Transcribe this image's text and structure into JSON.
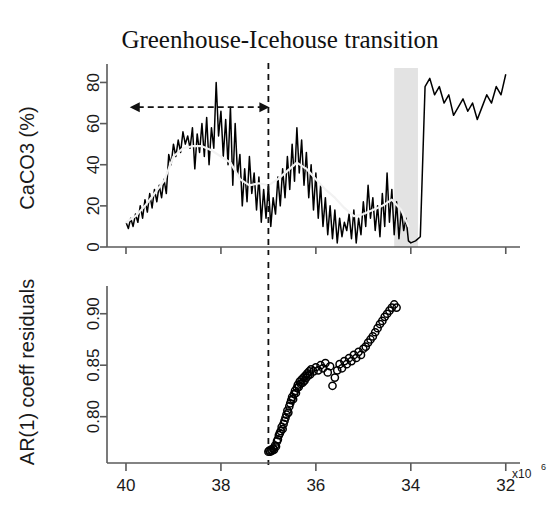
{
  "title": "Greenhouse-Icehouse transition",
  "chart_data": {
    "type": "line",
    "title": "Greenhouse-Icehouse transition",
    "panels": [
      {
        "id": "caco3-panel",
        "ylabel": "CaCO3 (%)",
        "ytick_labels": [
          "0",
          "20",
          "40",
          "60",
          "80"
        ],
        "ytick_values": [
          0,
          20,
          40,
          60,
          80
        ],
        "ylim": [
          0,
          88
        ],
        "grid": false,
        "series": [
          {
            "name": "CaCO3 record",
            "style": "noisy-line",
            "color": "#000000",
            "x": [
              40.0,
              39.95,
              39.9,
              39.85,
              39.8,
              39.75,
              39.7,
              39.65,
              39.6,
              39.55,
              39.5,
              39.45,
              39.4,
              39.35,
              39.3,
              39.25,
              39.2,
              39.15,
              39.1,
              39.05,
              39.0,
              38.95,
              38.9,
              38.85,
              38.8,
              38.75,
              38.7,
              38.65,
              38.6,
              38.55,
              38.5,
              38.45,
              38.4,
              38.35,
              38.3,
              38.25,
              38.2,
              38.15,
              38.1,
              38.05,
              38.0,
              37.95,
              37.9,
              37.85,
              37.8,
              37.75,
              37.7,
              37.65,
              37.6,
              37.55,
              37.5,
              37.45,
              37.4,
              37.35,
              37.3,
              37.25,
              37.2,
              37.15,
              37.1,
              37.05,
              37.0,
              36.95,
              36.9,
              36.85,
              36.8,
              36.75,
              36.7,
              36.65,
              36.6,
              36.55,
              36.5,
              36.45,
              36.4,
              36.35,
              36.3,
              36.25,
              36.2,
              36.15,
              36.1,
              36.05,
              36.0,
              35.95,
              35.9,
              35.85,
              35.8,
              35.75,
              35.7,
              35.65,
              35.6,
              35.55,
              35.5,
              35.45,
              35.4,
              35.35,
              35.3,
              35.25,
              35.2,
              35.15,
              35.1,
              35.05,
              35.0,
              34.95,
              34.9,
              34.85,
              34.8,
              34.75,
              34.7,
              34.65,
              34.6,
              34.55,
              34.5,
              34.45,
              34.4,
              34.35,
              34.3,
              34.25,
              34.2,
              34.15,
              34.1,
              34.05,
              34.0,
              33.9,
              33.8,
              33.7,
              33.6,
              33.5,
              33.4,
              33.3,
              33.2,
              33.1,
              33.0,
              32.9,
              32.8,
              32.7,
              32.6,
              32.5,
              32.4,
              32.3,
              32.2,
              32.1,
              32.0
            ],
            "y": [
              12,
              9,
              14,
              10,
              16,
              12,
              20,
              14,
              23,
              17,
              26,
              19,
              28,
              22,
              30,
              24,
              33,
              26,
              45,
              40,
              50,
              44,
              52,
              46,
              56,
              50,
              54,
              48,
              58,
              38,
              55,
              46,
              60,
              44,
              63,
              40,
              58,
              48,
              80,
              54,
              66,
              44,
              62,
              40,
              68,
              30,
              60,
              35,
              45,
              20,
              38,
              22,
              44,
              26,
              36,
              18,
              34,
              12,
              28,
              14,
              30,
              10,
              24,
              16,
              34,
              20,
              38,
              24,
              44,
              28,
              50,
              32,
              58,
              36,
              52,
              30,
              46,
              24,
              40,
              18,
              36,
              14,
              30,
              10,
              24,
              6,
              20,
              4,
              18,
              2,
              14,
              5,
              12,
              8,
              16,
              4,
              18,
              2,
              14,
              6,
              22,
              10,
              30,
              14,
              24,
              8,
              20,
              5,
              26,
              10,
              36,
              12,
              28,
              6,
              22,
              4,
              18,
              8,
              14,
              3,
              2,
              3,
              5,
              78,
              82,
              74,
              78,
              70,
              74,
              64,
              68,
              72,
              66,
              70,
              62,
              68,
              74,
              70,
              78,
              74,
              84
            ]
          },
          {
            "name": "CaCO3 smoothed trend",
            "style": "smooth-line",
            "color": "#f2f2f2",
            "x": [
              40.0,
              39.8,
              39.6,
              39.4,
              39.2,
              39.0,
              38.8,
              38.6,
              38.4,
              38.2,
              38.0,
              37.8,
              37.6,
              37.4,
              37.2,
              37.0,
              36.8,
              36.6,
              36.4,
              36.2,
              36.0,
              35.8,
              35.6,
              35.4,
              35.2,
              35.0,
              34.8,
              34.6,
              34.4,
              34.2,
              34.05
            ],
            "y": [
              12,
              15,
              20,
              26,
              32,
              44,
              48,
              49,
              49,
              47,
              44,
              41,
              33,
              30,
              31,
              30,
              33,
              37,
              41,
              38,
              33,
              28,
              24,
              19,
              15,
              16,
              18,
              20,
              23,
              18,
              10
            ]
          }
        ],
        "annotations": {
          "dashed_vertical_line_x": 37.0,
          "shaded_band": {
            "x_start": 34.35,
            "x_end": 33.85,
            "color": "#e3e3e3"
          },
          "double_arrow": {
            "x_start": 39.9,
            "x_end": 37.0,
            "y": 68,
            "style": "dashed-double-headed"
          }
        }
      },
      {
        "id": "ar1-panel",
        "ylabel": "AR(1) coeff residuals",
        "ytick_labels": [
          "0.80",
          "0.85",
          "0.90"
        ],
        "ytick_values": [
          0.8,
          0.85,
          0.9
        ],
        "ylim": [
          0.755,
          0.925
        ],
        "grid": false,
        "series": [
          {
            "name": "AR(1) coefficient residuals",
            "style": "open-circles",
            "color": "#000000",
            "x": [
              37.0,
              36.98,
              36.96,
              36.94,
              36.92,
              36.9,
              36.88,
              36.86,
              36.84,
              36.82,
              36.8,
              36.78,
              36.76,
              36.74,
              36.72,
              36.7,
              36.68,
              36.66,
              36.64,
              36.62,
              36.6,
              36.58,
              36.56,
              36.54,
              36.52,
              36.5,
              36.48,
              36.46,
              36.44,
              36.42,
              36.4,
              36.38,
              36.36,
              36.34,
              36.32,
              36.3,
              36.28,
              36.26,
              36.24,
              36.22,
              36.2,
              36.18,
              36.16,
              36.14,
              36.12,
              36.1,
              36.05,
              36.0,
              35.95,
              35.9,
              35.85,
              35.8,
              35.75,
              35.7,
              35.65,
              35.6,
              35.55,
              35.5,
              35.45,
              35.4,
              35.35,
              35.3,
              35.25,
              35.2,
              35.15,
              35.1,
              35.05,
              35.0,
              34.95,
              34.9,
              34.85,
              34.8,
              34.75,
              34.7,
              34.65,
              34.6,
              34.55,
              34.5,
              34.45,
              34.4,
              34.35,
              34.3
            ],
            "y": [
              0.766,
              0.767,
              0.766,
              0.768,
              0.767,
              0.769,
              0.768,
              0.772,
              0.771,
              0.776,
              0.778,
              0.782,
              0.784,
              0.786,
              0.79,
              0.788,
              0.793,
              0.796,
              0.799,
              0.802,
              0.806,
              0.804,
              0.81,
              0.813,
              0.816,
              0.819,
              0.817,
              0.822,
              0.825,
              0.823,
              0.828,
              0.831,
              0.829,
              0.834,
              0.832,
              0.836,
              0.833,
              0.838,
              0.835,
              0.84,
              0.838,
              0.842,
              0.84,
              0.844,
              0.841,
              0.846,
              0.844,
              0.848,
              0.845,
              0.85,
              0.847,
              0.852,
              0.843,
              0.849,
              0.83,
              0.838,
              0.845,
              0.851,
              0.847,
              0.854,
              0.851,
              0.857,
              0.854,
              0.86,
              0.857,
              0.863,
              0.86,
              0.866,
              0.868,
              0.872,
              0.875,
              0.878,
              0.882,
              0.886,
              0.89,
              0.893,
              0.897,
              0.9,
              0.903,
              0.906,
              0.909,
              0.906
            ]
          }
        ],
        "annotations": {
          "dashed_vertical_line_x": 37.0
        }
      }
    ],
    "xaxis": {
      "tick_labels": [
        "40",
        "38",
        "36",
        "34",
        "32"
      ],
      "tick_values": [
        40,
        38,
        36,
        34,
        32
      ],
      "xlim": [
        40.4,
        31.7
      ],
      "reversed": true,
      "exponent_label": "x10",
      "exponent_power": "6"
    }
  },
  "colors": {
    "raw_series": "#000000",
    "smooth_series": "#f2f2f2",
    "band": "#e3e3e3",
    "axis": "#5a5a5a",
    "text": "#1a1a1a"
  }
}
